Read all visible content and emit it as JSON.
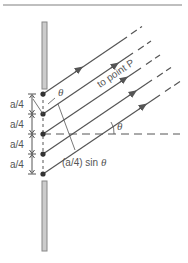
{
  "diagram": {
    "labels": {
      "spacing": [
        "a/4",
        "a/4",
        "a/4",
        "a/4"
      ],
      "theta_top": "θ",
      "theta_right": "θ",
      "to_point_p": "to point P",
      "path_diff_prefix": "(a/4) sin ",
      "path_diff_theta": "θ"
    },
    "colors": {
      "line": "#555555",
      "wall_fill": "#cccccc",
      "wall_stroke": "#888888",
      "top_rule": "#aaaaaa"
    }
  }
}
